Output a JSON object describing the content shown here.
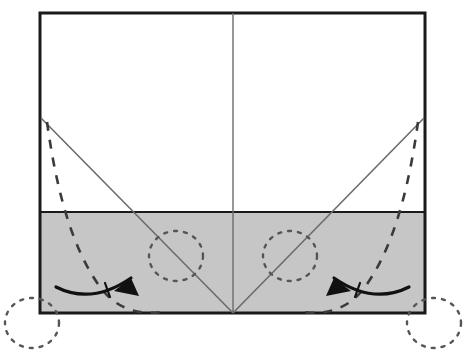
{
  "figure": {
    "background_color": "#ffffff"
  },
  "canvas": {
    "width": 465,
    "height": 362
  },
  "colors": {
    "outline": "#1a1a1a",
    "shaded_fill": "#c6c6c6",
    "crease_line": "#6b6b6b",
    "dashed_line": "#3a3a3a",
    "dotted_circle": "#555555",
    "arrow": "#111111",
    "paper_white": "#ffffff"
  },
  "paper": {
    "name": "paper-sheet",
    "left": 40,
    "top": 13,
    "right": 425,
    "bottom": 313,
    "border_width": 3
  },
  "shaded_band": {
    "name": "shaded-lower-band",
    "left": 40,
    "top": 212,
    "right": 425,
    "bottom": 313,
    "fill": "#c6c6c6"
  },
  "center_crease": {
    "name": "center-vertical-crease",
    "x": 233,
    "y_top": 13,
    "y_bottom": 313,
    "stroke": "#6b6b6b",
    "width": 1.4
  },
  "diagonal_creases": [
    {
      "name": "left-diagonal-crease",
      "x1": 41,
      "y1": 118,
      "x2": 233,
      "y2": 313,
      "stroke": "#6b6b6b",
      "width": 1.6
    },
    {
      "name": "right-diagonal-crease",
      "x1": 424,
      "y1": 118,
      "x2": 233,
      "y2": 313,
      "stroke": "#6b6b6b",
      "width": 1.6
    }
  ],
  "dashed_fold_arcs": [
    {
      "name": "left-dashed-mountain-arc",
      "path": "M 47,122 C 55,180 70,250 104,292 C 120,310 140,315 162,312",
      "dash": "9 9",
      "stroke": "#3a3a3a",
      "width": 2.6
    },
    {
      "name": "right-dashed-mountain-arc",
      "path": "M 418,122 C 410,180 395,250 361,292 C 345,310 325,315 303,312",
      "dash": "9 9",
      "stroke": "#3a3a3a",
      "width": 2.6
    }
  ],
  "dotted_circles": [
    {
      "name": "left-inner-destination-circle",
      "cx": 176,
      "cy": 256,
      "rx": 27,
      "ry": 25,
      "dash": "3 7",
      "stroke": "#555555",
      "width": 2.4
    },
    {
      "name": "right-inner-destination-circle",
      "cx": 290,
      "cy": 256,
      "rx": 27,
      "ry": 25,
      "dash": "3 7",
      "stroke": "#555555",
      "width": 2.4
    },
    {
      "name": "left-outer-origin-circle",
      "cx": 32,
      "cy": 323,
      "rx": 27,
      "ry": 25,
      "dash": "3 7",
      "stroke": "#555555",
      "width": 2.4
    },
    {
      "name": "right-outer-origin-circle",
      "cx": 434,
      "cy": 323,
      "rx": 27,
      "ry": 25,
      "dash": "3 7",
      "stroke": "#555555",
      "width": 2.4
    }
  ],
  "fold_arrows": [
    {
      "name": "left-fold-arrow",
      "direction": "right",
      "shaft_path": "M 56,287 C 82,300 108,294 131,278",
      "tick_path": "M 105,283 L 110,297",
      "head_points": "131,278 139,296 114,291",
      "stroke": "#111111",
      "width": 3.2
    },
    {
      "name": "right-fold-arrow",
      "direction": "left",
      "shaft_path": "M 409,287 C 383,300 357,294 334,278",
      "tick_path": "M 360,283 L 355,297",
      "head_points": "334,278 326,296 351,291",
      "stroke": "#111111",
      "width": 3.2
    }
  ]
}
